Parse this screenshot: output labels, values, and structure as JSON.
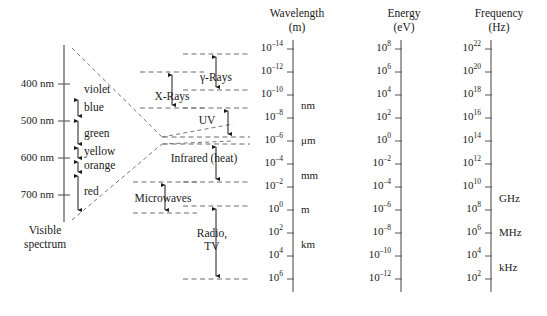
{
  "figure": {
    "kind": "electromagnetic-spectrum-diagram"
  },
  "visible_spectrum": {
    "caption_line1": "Visible",
    "caption_line2": "spectrum",
    "axis_ticks": [
      {
        "label": "400 nm",
        "y": 84
      },
      {
        "label": "500 nm",
        "y": 121
      },
      {
        "label": "600 nm",
        "y": 158
      },
      {
        "label": "700 nm",
        "y": 195
      }
    ],
    "colors": [
      {
        "name": "violet",
        "y": 90
      },
      {
        "name": "blue",
        "y": 108
      },
      {
        "name": "green",
        "y": 134
      },
      {
        "name": "yellow",
        "y": 152
      },
      {
        "name": "orange",
        "y": 166
      },
      {
        "name": "red",
        "y": 192
      }
    ]
  },
  "bands": [
    {
      "name": "γ-Rays",
      "label_x": 216,
      "label_y": 78
    },
    {
      "name": "X-Rays",
      "label_x": 172,
      "label_y": 97
    },
    {
      "name": "UV",
      "label_x": 207,
      "label_y": 121
    },
    {
      "name": "Infrared (heat)",
      "label_x": 204,
      "label_y": 159
    },
    {
      "name": "Microwaves",
      "label_x": 163,
      "label_y": 199
    },
    {
      "name": "Radio,",
      "label_x": 212,
      "label_y": 234
    },
    {
      "name": "TV",
      "label_x": 212,
      "label_y": 247
    }
  ],
  "scales": [
    {
      "id": "wavelength",
      "title": "Wavelength",
      "unit": "(m)",
      "title_x": 297,
      "axis_x": 293,
      "ticks": [
        {
          "mantissa": "10",
          "exponent": "–14",
          "y": 49
        },
        {
          "mantissa": "10",
          "exponent": "–12",
          "y": 72
        },
        {
          "mantissa": "10",
          "exponent": "–10",
          "y": 95
        },
        {
          "mantissa": "10",
          "exponent": "–8",
          "y": 118
        },
        {
          "mantissa": "10",
          "exponent": "–6",
          "y": 141
        },
        {
          "mantissa": "10",
          "exponent": "–4",
          "y": 164
        },
        {
          "mantissa": "10",
          "exponent": "–2",
          "y": 187
        },
        {
          "mantissa": "10",
          "exponent": "0",
          "y": 210
        },
        {
          "mantissa": "10",
          "exponent": "2",
          "y": 233
        },
        {
          "mantissa": "10",
          "exponent": "4",
          "y": 256
        },
        {
          "mantissa": "10",
          "exponent": "6",
          "y": 279
        }
      ],
      "notes": [
        {
          "text": "nm",
          "y": 106
        },
        {
          "text": "μm",
          "y": 141
        },
        {
          "text": "mm",
          "y": 176
        },
        {
          "text": "m",
          "y": 210
        },
        {
          "text": "km",
          "y": 245
        }
      ]
    },
    {
      "id": "energy",
      "title": "Energy",
      "unit": "(eV)",
      "title_x": 404,
      "axis_x": 401,
      "ticks": [
        {
          "mantissa": "10",
          "exponent": "8",
          "y": 49
        },
        {
          "mantissa": "10",
          "exponent": "6",
          "y": 72
        },
        {
          "mantissa": "10",
          "exponent": "4",
          "y": 95
        },
        {
          "mantissa": "10",
          "exponent": "2",
          "y": 118
        },
        {
          "mantissa": "10",
          "exponent": "0",
          "y": 141
        },
        {
          "mantissa": "10",
          "exponent": "–2",
          "y": 164
        },
        {
          "mantissa": "10",
          "exponent": "–4",
          "y": 187
        },
        {
          "mantissa": "10",
          "exponent": "–6",
          "y": 210
        },
        {
          "mantissa": "10",
          "exponent": "–8",
          "y": 233
        },
        {
          "mantissa": "10",
          "exponent": "–10",
          "y": 256
        },
        {
          "mantissa": "10",
          "exponent": "–12",
          "y": 279
        }
      ],
      "notes": []
    },
    {
      "id": "frequency",
      "title": "Frequency",
      "unit": "(Hz)",
      "title_x": 499,
      "axis_x": 491,
      "ticks": [
        {
          "mantissa": "10",
          "exponent": "22",
          "y": 49
        },
        {
          "mantissa": "10",
          "exponent": "20",
          "y": 72
        },
        {
          "mantissa": "10",
          "exponent": "18",
          "y": 95
        },
        {
          "mantissa": "10",
          "exponent": "16",
          "y": 118
        },
        {
          "mantissa": "10",
          "exponent": "14",
          "y": 141
        },
        {
          "mantissa": "10",
          "exponent": "12",
          "y": 164
        },
        {
          "mantissa": "10",
          "exponent": "10",
          "y": 187
        },
        {
          "mantissa": "10",
          "exponent": "8",
          "y": 210
        },
        {
          "mantissa": "10",
          "exponent": "6",
          "y": 233
        },
        {
          "mantissa": "10",
          "exponent": "4",
          "y": 256
        },
        {
          "mantissa": "10",
          "exponent": "2",
          "y": 279
        }
      ],
      "notes": [
        {
          "text": "GHz",
          "y": 199
        },
        {
          "text": "MHz",
          "y": 233
        },
        {
          "text": "kHz",
          "y": 268
        }
      ]
    }
  ],
  "colors": {
    "ink": "#1a1a1a",
    "rule": "#555555",
    "dash": "#666666"
  }
}
